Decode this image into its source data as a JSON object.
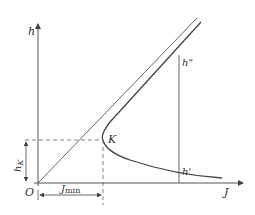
{
  "diagram": {
    "axes": {
      "y_label": "h",
      "x_label": "J",
      "origin_label": "O"
    },
    "points": {
      "K": "K",
      "h_double_prime": "h\"",
      "h_prime": "h'"
    },
    "dimensions": {
      "hK_main": "h",
      "hK_sub": "K",
      "Jmin_main": "J",
      "Jmin_sub": "min"
    },
    "colors": {
      "line": "#555555",
      "curve": "#444444",
      "text": "#333333"
    }
  }
}
